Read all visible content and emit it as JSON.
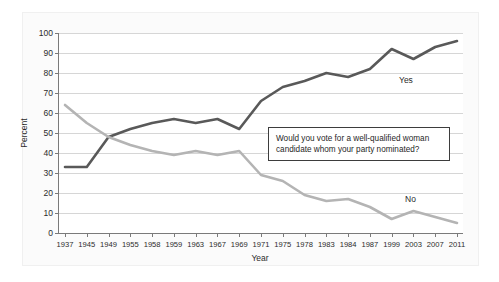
{
  "chart_data": {
    "type": "line",
    "title": "",
    "subtitle": "",
    "xlabel": "Year",
    "ylabel": "Percent",
    "categories": [
      "1937",
      "1945",
      "1949",
      "1955",
      "1958",
      "1959",
      "1963",
      "1967",
      "1969",
      "1971",
      "1975",
      "1978",
      "1983",
      "1984",
      "1987",
      "1999",
      "2003",
      "2007",
      "2011"
    ],
    "series": [
      {
        "name": "Yes",
        "color": "#595959",
        "values": [
          33,
          33,
          48,
          52,
          55,
          57,
          55,
          57,
          52,
          66,
          73,
          76,
          80,
          78,
          82,
          92,
          87,
          93,
          96
        ]
      },
      {
        "name": "No",
        "color": "#b4b4b4",
        "values": [
          64,
          55,
          48,
          44,
          41,
          39,
          41,
          39,
          41,
          29,
          26,
          19,
          16,
          17,
          13,
          7,
          11,
          8,
          5
        ]
      }
    ],
    "ylim": [
      0,
      100
    ],
    "ytick_values": [
      0,
      10,
      20,
      30,
      40,
      50,
      60,
      70,
      80,
      90,
      100
    ],
    "ytick_labels": [
      "0",
      "10",
      "20",
      "30",
      "40",
      "50",
      "60",
      "70",
      "80",
      "90",
      "100"
    ],
    "grid": true,
    "grid_axis": "y",
    "legend": "inline-series-labels",
    "annotations": [
      {
        "name": "question-callout",
        "text": "Would you vote for a well-qualified woman candidate whom your party nominated?"
      }
    ]
  },
  "series_labels": {
    "yes": "Yes",
    "no": "No"
  },
  "colors": {
    "yes_line": "#595959",
    "no_line": "#b4b4b4",
    "axis": "#7a7a7a",
    "grid": "#d6d6d6",
    "annotation_border": "#3d3d3d"
  }
}
